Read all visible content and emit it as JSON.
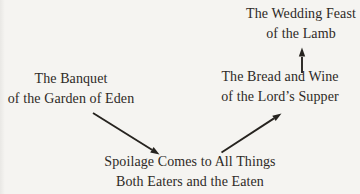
{
  "page": {
    "background_color": "#f5f4f1",
    "text_color": "#2e2a26",
    "arrow_color": "#26231f"
  },
  "diagram": {
    "nodes": [
      {
        "id": "wedding-feast",
        "lines": [
          "The Wedding Feast",
          "of the Lamb"
        ]
      },
      {
        "id": "banquet",
        "lines": [
          "The Banquet",
          "of the Garden of Eden"
        ]
      },
      {
        "id": "bread-wine",
        "lines": [
          "The Bread and Wine",
          "of the Lord’s Supper"
        ]
      },
      {
        "id": "spoilage",
        "lines": [
          "Spoilage Comes to All Things",
          "Both Eaters and the Eaten"
        ]
      }
    ],
    "arrows": [
      {
        "from": "banquet",
        "to": "spoilage",
        "direction": "down-right"
      },
      {
        "from": "spoilage",
        "to": "bread-wine",
        "direction": "up-right"
      },
      {
        "from": "bread-wine",
        "to": "wedding-feast",
        "direction": "up"
      }
    ]
  }
}
